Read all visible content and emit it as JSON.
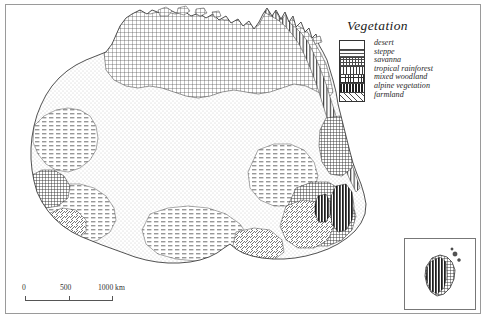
{
  "figure": {
    "kind": "thematic-map"
  },
  "legend": {
    "title": "Vegetation",
    "items": [
      {
        "label": "desert",
        "pattern": "stipple-light"
      },
      {
        "label": "steppe",
        "pattern": "horizontal-dash"
      },
      {
        "label": "savanna",
        "pattern": "crosshatch-fine"
      },
      {
        "label": "tropical rainforest",
        "pattern": "vertical-lines"
      },
      {
        "label": "mixed woodland",
        "pattern": "crosshatch-dense"
      },
      {
        "label": "alpine vegetation",
        "pattern": "vertical-bold"
      },
      {
        "label": "farmland",
        "pattern": "diagonal-lines"
      }
    ]
  },
  "scalebar": {
    "ticks": [
      "0",
      "500",
      "1000 km"
    ],
    "unit": "km"
  },
  "inset": {
    "name": "Tasmania inset"
  },
  "colors": {
    "ink": "#2a2a2a",
    "frame": "#9a9a9a",
    "paper": "#ffffff"
  }
}
